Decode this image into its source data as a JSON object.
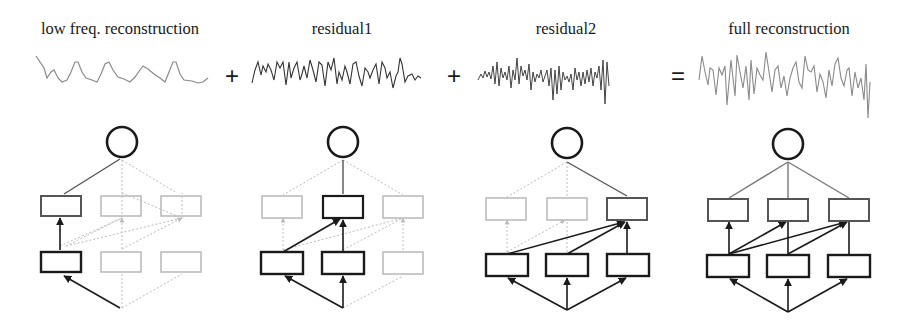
{
  "panels": [
    {
      "label": "low freq. reconstruction",
      "center_x": 120,
      "active": {
        "bottom": [
          0
        ],
        "middle": [
          0
        ],
        "top": [
          0
        ]
      }
    },
    {
      "label": "residual1",
      "center_x": 342,
      "active": {
        "bottom": [
          0,
          1
        ],
        "middle": [
          1
        ],
        "top": [
          1
        ]
      }
    },
    {
      "label": "residual2",
      "center_x": 566,
      "active": {
        "bottom": [
          0,
          1,
          2
        ],
        "middle": [
          2
        ],
        "top": [
          2
        ]
      }
    },
    {
      "label": "full reconstruction",
      "center_x": 789,
      "active": {
        "bottom": [
          0,
          1,
          2
        ],
        "middle": [
          0,
          1,
          2
        ],
        "top": [
          0,
          1,
          2
        ]
      }
    }
  ],
  "operators": [
    {
      "symbol": "+",
      "x": 232,
      "y": 76
    },
    {
      "symbol": "+",
      "x": 454,
      "y": 76
    },
    {
      "symbol": "=",
      "x": 678,
      "y": 76
    }
  ],
  "colors": {
    "active": "#1a1a1a",
    "active_mid": "#555555",
    "inactive": "#bcbcbc",
    "wave_light": "#8a8a8a",
    "wave_dark": "#3a3a3a"
  }
}
